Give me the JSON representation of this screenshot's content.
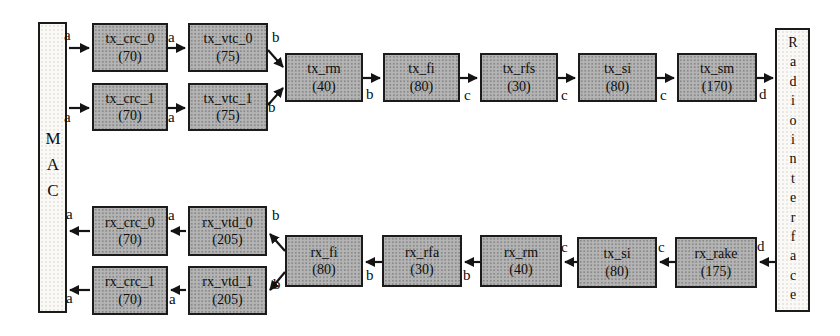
{
  "colors": {
    "block_fill": "#b4b4b4",
    "endpoint_fill": "#faf9f6",
    "border": "#1b1b1b",
    "arrow": "#141414"
  },
  "endpoints": {
    "mac": {
      "label": "MAC"
    },
    "radio": {
      "label": "Radiointerface"
    }
  },
  "blocks": {
    "tx_crc_0": {
      "name": "tx_crc_0",
      "cost": "(70)"
    },
    "tx_vtc_0": {
      "name": "tx_vtc_0",
      "cost": "(75)"
    },
    "tx_crc_1": {
      "name": "tx_crc_1",
      "cost": "(70)"
    },
    "tx_vtc_1": {
      "name": "tx_vtc_1",
      "cost": "(75)"
    },
    "tx_rm": {
      "name": "tx_rm",
      "cost": "(40)"
    },
    "tx_fi": {
      "name": "tx_fi",
      "cost": "(80)"
    },
    "tx_rfs": {
      "name": "tx_rfs",
      "cost": "(30)"
    },
    "tx_si": {
      "name": "tx_si",
      "cost": "(80)"
    },
    "tx_sm": {
      "name": "tx_sm",
      "cost": "(170)"
    },
    "rx_crc_0": {
      "name": "rx_crc_0",
      "cost": "(70)"
    },
    "rx_vtd_0": {
      "name": "rx_vtd_0",
      "cost": "(205)"
    },
    "rx_crc_1": {
      "name": "rx_crc_1",
      "cost": "(70)"
    },
    "rx_vtd_1": {
      "name": "rx_vtd_1",
      "cost": "(205)"
    },
    "rx_fi": {
      "name": "rx_fi",
      "cost": "(80)"
    },
    "rx_rfa": {
      "name": "rx_rfa",
      "cost": "(30)"
    },
    "rx_rm": {
      "name": "rx_rm",
      "cost": "(40)"
    },
    "tx_si_rx": {
      "name": "tx_si",
      "cost": "(80)"
    },
    "rx_rake": {
      "name": "rx_rake",
      "cost": "(175)"
    }
  },
  "edges": [
    {
      "from": "MAC",
      "to": "tx_crc_0",
      "label": "a"
    },
    {
      "from": "tx_crc_0",
      "to": "tx_vtc_0",
      "label": "a"
    },
    {
      "from": "tx_vtc_0",
      "to": "tx_rm",
      "label": "b"
    },
    {
      "from": "MAC",
      "to": "tx_crc_1",
      "label": "a"
    },
    {
      "from": "tx_crc_1",
      "to": "tx_vtc_1",
      "label": "a"
    },
    {
      "from": "tx_vtc_1",
      "to": "tx_rm",
      "label": "b"
    },
    {
      "from": "tx_rm",
      "to": "tx_fi",
      "label": "b"
    },
    {
      "from": "tx_fi",
      "to": "tx_rfs",
      "label": "c"
    },
    {
      "from": "tx_rfs",
      "to": "tx_si",
      "label": "c"
    },
    {
      "from": "tx_si",
      "to": "tx_sm",
      "label": "c"
    },
    {
      "from": "tx_sm",
      "to": "Radiointerface",
      "label": "d"
    },
    {
      "from": "Radiointerface",
      "to": "rx_rake",
      "label": "d"
    },
    {
      "from": "rx_rake",
      "to": "tx_si",
      "label": "c"
    },
    {
      "from": "tx_si",
      "to": "rx_rm",
      "label": "c"
    },
    {
      "from": "rx_rm",
      "to": "rx_rfa",
      "label": "b"
    },
    {
      "from": "rx_rfa",
      "to": "rx_fi",
      "label": "b"
    },
    {
      "from": "rx_fi",
      "to": "rx_vtd_0",
      "label": "b"
    },
    {
      "from": "rx_fi",
      "to": "rx_vtd_1",
      "label": "b"
    },
    {
      "from": "rx_vtd_0",
      "to": "rx_crc_0",
      "label": "a"
    },
    {
      "from": "rx_crc_0",
      "to": "MAC",
      "label": "a"
    },
    {
      "from": "rx_vtd_1",
      "to": "rx_crc_1",
      "label": "a"
    },
    {
      "from": "rx_crc_1",
      "to": "MAC",
      "label": "a"
    }
  ]
}
